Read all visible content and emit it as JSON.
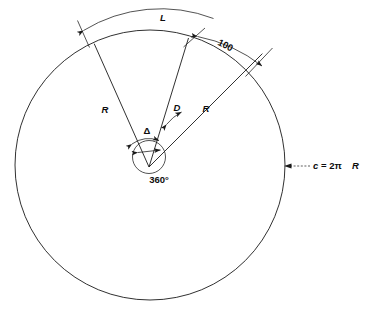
{
  "figure": {
    "background_color": "#ffffff",
    "line_color": "#1a1a1a",
    "text_color": "#0d0d0d"
  },
  "labels": {
    "arc_length": "L",
    "chord_station": "100",
    "radius_left": "R",
    "radius_right": "R",
    "delta_angle": "Δ",
    "degree_of_curve": "D",
    "full_circle": "360°",
    "circumference_c": "c",
    "circumference_eq": "= 2π",
    "circumference_r": "R"
  },
  "geometry": {
    "circle_center_x": 150,
    "circle_center_y": 165,
    "circle_radius": 135,
    "vertex_x": 149,
    "vertex_y": 167,
    "inner_circle_radius": 16,
    "ray_left_angle_deg": 246,
    "ray_mid_angle_deg": 287,
    "ray_right_angle_deg": 303
  },
  "annotations": {
    "c_equals_2piR": "c = 2π R",
    "units_note": ""
  }
}
